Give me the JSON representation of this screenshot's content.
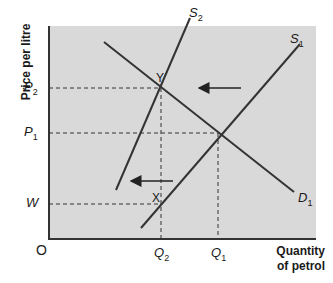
{
  "diagram": {
    "type": "supply-demand",
    "background_color": "#d9d9d9",
    "line_color": "#333333",
    "axes": {
      "y_label": "Price per litre",
      "x_label_line1": "Quantity",
      "x_label_line2": "of petrol",
      "origin": "O"
    },
    "y_ticks": [
      {
        "label": "P",
        "sub": "2"
      },
      {
        "label": "P",
        "sub": "1"
      },
      {
        "label": "W",
        "sub": ""
      }
    ],
    "x_ticks": [
      {
        "label": "Q",
        "sub": "2"
      },
      {
        "label": "Q",
        "sub": "1"
      }
    ],
    "curves": [
      {
        "name": "S",
        "sub": "2",
        "kind": "supply"
      },
      {
        "name": "S",
        "sub": "1",
        "kind": "supply"
      },
      {
        "name": "D",
        "sub": "1",
        "kind": "demand"
      }
    ],
    "points": [
      {
        "label": "Y"
      },
      {
        "label": "X"
      }
    ],
    "arrows": [
      {
        "direction": "left",
        "meaning": "supply-shift"
      },
      {
        "direction": "left",
        "meaning": "supply-shift"
      }
    ]
  }
}
